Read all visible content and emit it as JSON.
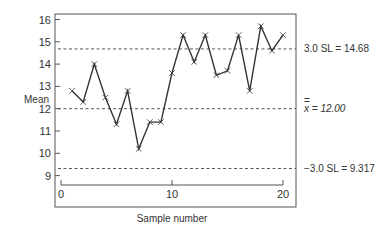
{
  "chart_data": {
    "type": "line",
    "title": "",
    "xlabel": "Sample number",
    "ylabel": "Mean",
    "x": [
      1,
      2,
      3,
      4,
      5,
      6,
      7,
      8,
      9,
      10,
      11,
      12,
      13,
      14,
      15,
      16,
      17,
      18,
      19,
      20
    ],
    "series": [
      {
        "name": "Sample mean",
        "marker": "x",
        "values": [
          12.8,
          12.3,
          14.0,
          12.5,
          11.3,
          12.8,
          10.2,
          11.4,
          11.4,
          13.6,
          15.3,
          14.1,
          15.3,
          13.5,
          13.7,
          15.3,
          12.8,
          15.7,
          14.6,
          15.3
        ]
      }
    ],
    "xlim": [
      0,
      20
    ],
    "ylim": [
      8.3,
      16.2
    ],
    "x_ticks": [
      0,
      10,
      20
    ],
    "y_ticks": [
      9,
      10,
      11,
      12,
      13,
      14,
      15,
      16
    ],
    "grid": false,
    "legend": "none",
    "control_limits": [
      {
        "name": "UCL",
        "label": "3.0 SL = 14.68",
        "value": 14.68,
        "style": "dashed"
      },
      {
        "name": "Center",
        "label": "x̄̄ = 12.00",
        "value": 12.0,
        "style": "dashed"
      },
      {
        "name": "LCL",
        "label": "−3.0 SL = 9.317",
        "value": 9.317,
        "style": "dashed"
      }
    ]
  },
  "labels": {
    "ylabel": "Mean",
    "xlabel": "Sample number",
    "ucl": "3.0 SL = 14.68",
    "center_bar": "=",
    "center": "x = 12.00",
    "lcl": "−3.0 SL = 9.317"
  },
  "colors": {
    "line": "#333333",
    "frame": "#555555",
    "dashed": "#444444",
    "text": "#333333"
  }
}
